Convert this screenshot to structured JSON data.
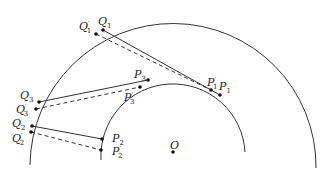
{
  "diagram": {
    "center": {
      "label": "O",
      "x": 173,
      "y": 152
    },
    "outer_arc": {
      "radius": 140
    },
    "inner_arc": {
      "radius": 72
    },
    "colors": {
      "stroke": "#333333",
      "point": "#111111"
    },
    "points": {
      "Q1": {
        "label": "Q",
        "sub": "1",
        "prime": "",
        "x": 103,
        "y": 30
      },
      "Q1p": {
        "label": "Q",
        "sub": "1",
        "prime": "′",
        "x": 96,
        "y": 34
      },
      "P1": {
        "label": "P",
        "sub": "1",
        "prime": "",
        "x": 220,
        "y": 95
      },
      "P1p": {
        "label": "P",
        "sub": "1",
        "prime": "′",
        "x": 211,
        "y": 90
      },
      "Q3": {
        "label": "Q",
        "sub": "3",
        "prime": "",
        "x": 39,
        "y": 102
      },
      "Q3p": {
        "label": "Q",
        "sub": "3",
        "prime": "′",
        "x": 36,
        "y": 109
      },
      "P3": {
        "label": "P",
        "sub": "3",
        "prime": "",
        "x": 148,
        "y": 80
      },
      "P3p": {
        "label": "P",
        "sub": "3",
        "prime": "′",
        "x": 140,
        "y": 87
      },
      "Q2": {
        "label": "Q",
        "sub": "2",
        "prime": "",
        "x": 32,
        "y": 126
      },
      "Q2p": {
        "label": "Q",
        "sub": "2",
        "prime": "′",
        "x": 31,
        "y": 132
      },
      "P2": {
        "label": "P",
        "sub": "2",
        "prime": "",
        "x": 102,
        "y": 139
      },
      "P2p": {
        "label": "P",
        "sub": "2",
        "prime": "′",
        "x": 101,
        "y": 150
      }
    },
    "segments_solid": [
      [
        "Q1",
        "P1"
      ],
      [
        "Q3",
        "P3"
      ],
      [
        "Q2",
        "P2"
      ]
    ],
    "segments_dashed": [
      [
        "Q1p",
        "P1p"
      ],
      [
        "Q3p",
        "P3p"
      ],
      [
        "Q2p",
        "P2p"
      ]
    ]
  }
}
